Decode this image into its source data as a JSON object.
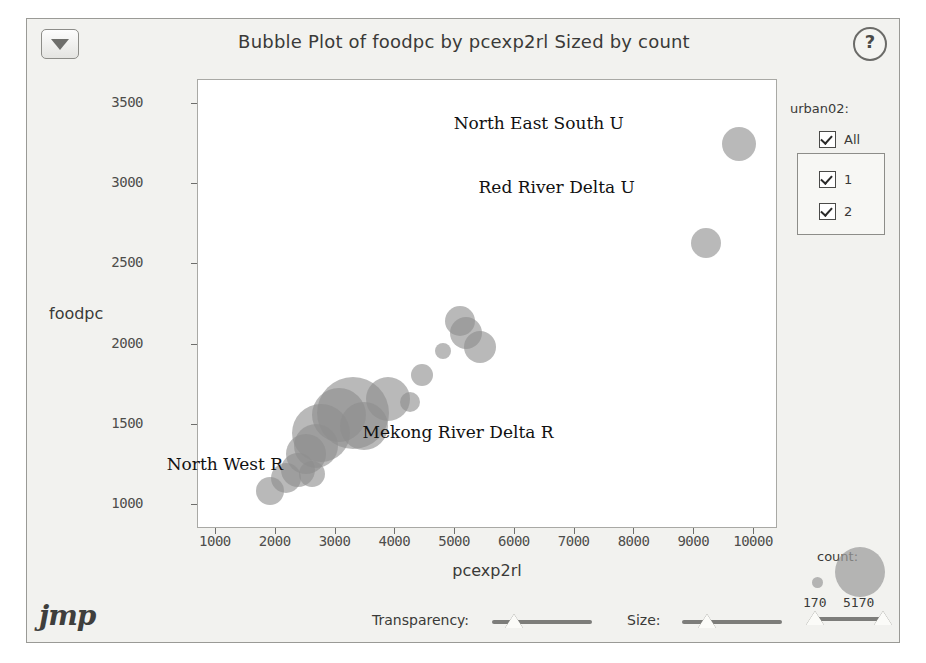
{
  "window": {
    "title": "Bubble Plot of foodpc by pcexp2rl Sized by count",
    "disclosure_icon": "triangle-down-icon",
    "help_icon": "?",
    "brand": "jmp"
  },
  "legend": {
    "title": "urban02:",
    "all_label": "All",
    "groups": [
      {
        "label": "1",
        "checked": true
      },
      {
        "label": "2",
        "checked": true
      }
    ],
    "all_checked": true
  },
  "size_legend": {
    "title": "count:",
    "min_label": "170",
    "max_label": "5170"
  },
  "controls": {
    "transparency_label": "Transparency:",
    "size_label": "Size:",
    "transparency_value": 22,
    "size_value": 25
  },
  "colors": {
    "bubble_fill": "#8e8e8e",
    "panel_bg": "#f2f2ef",
    "plot_bg": "#ffffff",
    "frame": "#a9a9a5",
    "text": "#3a3a38"
  },
  "chart_data": {
    "type": "scatter",
    "title": "Bubble Plot of foodpc by pcexp2rl Sized by count",
    "xlabel": "pcexp2rl",
    "ylabel": "foodpc",
    "xlim": [
      700,
      10400
    ],
    "ylim": [
      850,
      3650
    ],
    "xticks": [
      1000,
      2000,
      3000,
      4000,
      5000,
      6000,
      7000,
      8000,
      9000,
      10000
    ],
    "yticks": [
      1000,
      1500,
      2000,
      2500,
      3000,
      3500
    ],
    "grid": false,
    "legend_position": "right",
    "size_field": "count",
    "size_range": [
      170,
      5170
    ],
    "annotations": [
      {
        "text": "North East South U",
        "x": 6400,
        "y": 3380
      },
      {
        "text": "Red River Delta U",
        "x": 6700,
        "y": 2980
      },
      {
        "text": "Mekong River Delta R",
        "x": 5050,
        "y": 1455
      },
      {
        "text": "North West R",
        "x": 1150,
        "y": 1255
      }
    ],
    "points": [
      {
        "x": 9740,
        "y": 3250,
        "r": 17
      },
      {
        "x": 9200,
        "y": 2635,
        "r": 15
      },
      {
        "x": 5080,
        "y": 2150,
        "r": 15
      },
      {
        "x": 5180,
        "y": 2075,
        "r": 16
      },
      {
        "x": 5420,
        "y": 1985,
        "r": 16
      },
      {
        "x": 4800,
        "y": 1960,
        "r": 8
      },
      {
        "x": 4440,
        "y": 1810,
        "r": 11
      },
      {
        "x": 4250,
        "y": 1640,
        "r": 10
      },
      {
        "x": 3880,
        "y": 1660,
        "r": 22
      },
      {
        "x": 3300,
        "y": 1575,
        "r": 36
      },
      {
        "x": 3060,
        "y": 1560,
        "r": 27
      },
      {
        "x": 2760,
        "y": 1450,
        "r": 29
      },
      {
        "x": 2680,
        "y": 1365,
        "r": 22
      },
      {
        "x": 2500,
        "y": 1320,
        "r": 20
      },
      {
        "x": 2380,
        "y": 1215,
        "r": 17
      },
      {
        "x": 2180,
        "y": 1165,
        "r": 15
      },
      {
        "x": 1900,
        "y": 1085,
        "r": 14
      },
      {
        "x": 2600,
        "y": 1195,
        "r": 13
      },
      {
        "x": 3470,
        "y": 1495,
        "r": 24
      }
    ]
  }
}
